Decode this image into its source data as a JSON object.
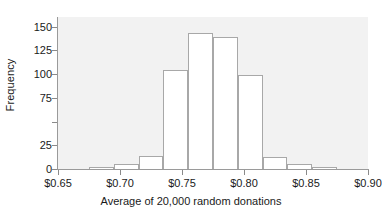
{
  "chart_data": {
    "type": "bar",
    "subtype": "histogram",
    "title": "",
    "xlabel": "Average of 20,000 random donations",
    "ylabel": "Frequency",
    "xlim": [
      0.65,
      0.9
    ],
    "ylim": [
      0,
      160
    ],
    "grid": false,
    "legend": null,
    "bin_width": 0.02,
    "bin_edges": [
      0.675,
      0.695,
      0.715,
      0.735,
      0.755,
      0.775,
      0.795,
      0.815,
      0.835,
      0.855,
      0.875
    ],
    "categories": [
      "0.675-0.695",
      "0.695-0.715",
      "0.715-0.735",
      "0.735-0.755",
      "0.755-0.775",
      "0.775-0.795",
      "0.795-0.815",
      "0.815-0.835",
      "0.835-0.855",
      "0.855-0.875"
    ],
    "values": [
      2,
      5,
      14,
      104,
      143,
      139,
      99,
      13,
      5,
      2
    ],
    "xticks": [
      0.65,
      0.7,
      0.75,
      0.8,
      0.85,
      0.9
    ],
    "xtick_labels": [
      "$0.65",
      "$0.70",
      "$0.75",
      "$0.80",
      "$0.85",
      "$0.90"
    ],
    "yticks": [
      0,
      25,
      50,
      75,
      100,
      125,
      150
    ],
    "ytick_labels": [
      "0",
      "25",
      "",
      "75",
      "100",
      "125",
      "150"
    ],
    "colors": {
      "plot_background": "#f2f2f2",
      "figure_background": "#ffffff",
      "bar_fill": "#ffffff",
      "bar_edge": "#a8a8a8",
      "axis": "#9a9a9a",
      "text": "#1a1a1a"
    }
  }
}
